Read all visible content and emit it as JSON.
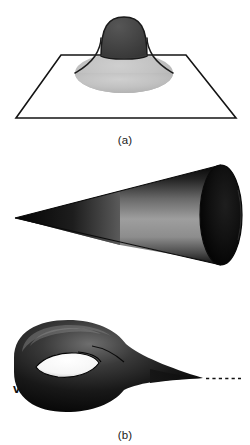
{
  "figure": {
    "title": "",
    "background_color": "#ffffff",
    "panels": [
      {
        "id": "a",
        "caption": "(a)",
        "description": "bump on a plane",
        "elements": {
          "plane_label": "plane",
          "dome_label": "dome",
          "skirt_label": "skirt"
        },
        "colors": {
          "plane_outline": "#141414",
          "plane_fill": "#ffffff",
          "dome_dark": "#454545",
          "dome_darker": "#3a3a3a",
          "skirt_light": "#c0c0c0",
          "skirt_mid": "#b0b0b0"
        }
      },
      {
        "id": "b",
        "caption": "(b)",
        "description": "cone with vertex v opening to an elliptical mouth",
        "elements": {
          "vertex_label": "v",
          "mouth_label": "cone mouth"
        },
        "colors": {
          "cone_dark": "#0a0a0a",
          "cone_mid": "#8c8c8c",
          "cone_light": "#a6a6a6",
          "mouth_dark": "#050505",
          "outline": "#111111"
        }
      },
      {
        "id": "c",
        "caption": "(c)",
        "description": "horn torus tapering to an infinite cusp",
        "elements": {
          "infinity_label": "∞",
          "dashed_label": "dashed extension",
          "hole_label": "hole"
        },
        "colors": {
          "horn_dark": "#0d0d0d",
          "horn_highlight": "#6b6b6b",
          "hole_fill": "#ffffff",
          "dash_color": "#111111"
        }
      }
    ]
  }
}
